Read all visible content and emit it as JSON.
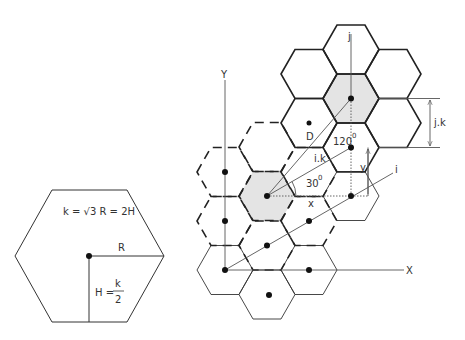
{
  "left_hexagon": {
    "formula": "k = √3 R = 2H",
    "radius_label": "R",
    "height_label_prefix": "H =",
    "height_frac_num": "k",
    "height_frac_den": "2"
  },
  "lattice": {
    "axis_y_label": "Y",
    "axis_x_label": "X",
    "axis_j_label": "j",
    "axis_i_label": "i",
    "distance_label": "D",
    "ik_label": "i.k",
    "jk_label": "j.k",
    "angle_120_label": "120",
    "angle_30_label": "30",
    "degree_mark": "0",
    "x_label": "x",
    "y_label": "y"
  },
  "colors": {
    "stroke": "#222222",
    "shade": "#e4e4e4",
    "text": "#333333"
  }
}
